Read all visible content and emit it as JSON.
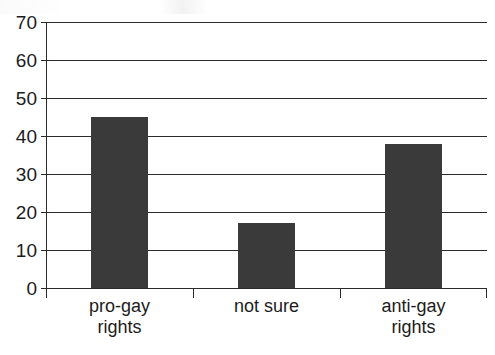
{
  "chart_data": {
    "type": "bar",
    "title": "",
    "xlabel": "",
    "ylabel": "",
    "categories": [
      "pro-gay rights",
      "not sure",
      "anti-gay rights"
    ],
    "category_lines": [
      [
        "pro-gay",
        "rights"
      ],
      [
        "not sure",
        ""
      ],
      [
        "anti-gay",
        "rights"
      ]
    ],
    "values": [
      45,
      17,
      38
    ],
    "ylim": [
      0,
      70
    ],
    "yticks": [
      0,
      10,
      20,
      30,
      40,
      50,
      60,
      70
    ],
    "ytick_labels": [
      "0",
      "10",
      "20",
      "30",
      "40",
      "50",
      "60",
      "70"
    ],
    "grid": true,
    "grid_axis": "y",
    "legend": false,
    "bar_color": "#3a3a3a",
    "axis_color": "#2b2b2b",
    "background_color": "#ffffff"
  },
  "axis": {
    "y": {
      "ticks": [
        {
          "value": 70,
          "label": "70"
        },
        {
          "value": 60,
          "label": "60"
        },
        {
          "value": 50,
          "label": "50"
        },
        {
          "value": 40,
          "label": "40"
        },
        {
          "value": 30,
          "label": "30"
        },
        {
          "value": 20,
          "label": "20"
        },
        {
          "value": 10,
          "label": "10"
        },
        {
          "value": 0,
          "label": "0"
        }
      ]
    },
    "x": {
      "categories": [
        {
          "label_line1": "pro-gay",
          "label_line2": "rights"
        },
        {
          "label_line1": "not sure",
          "label_line2": ""
        },
        {
          "label_line1": "anti-gay",
          "label_line2": "rights"
        }
      ]
    }
  },
  "bars": [
    {
      "category": "pro-gay rights",
      "value": 45
    },
    {
      "category": "not sure",
      "value": 17
    },
    {
      "category": "anti-gay rights",
      "value": 38
    }
  ]
}
